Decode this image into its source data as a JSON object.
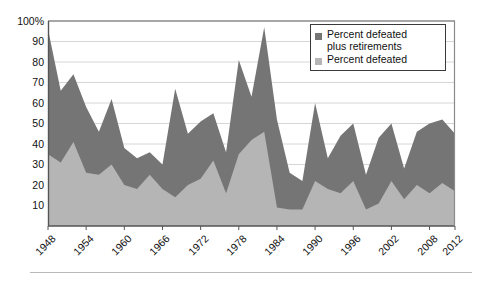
{
  "chart_data": {
    "type": "area",
    "title": "",
    "subtitle": "",
    "xlabel": "",
    "ylabel": "",
    "ylim": [
      0,
      100
    ],
    "yticks": [
      "10",
      "20",
      "30",
      "40",
      "50",
      "60",
      "70",
      "80",
      "90",
      "100%"
    ],
    "ytick_values": [
      10,
      20,
      30,
      40,
      50,
      60,
      70,
      80,
      90,
      100
    ],
    "grid": true,
    "legend_position": "top-right",
    "x": [
      1948,
      1950,
      1952,
      1954,
      1956,
      1958,
      1960,
      1962,
      1964,
      1966,
      1968,
      1970,
      1972,
      1974,
      1976,
      1978,
      1980,
      1982,
      1984,
      1986,
      1988,
      1990,
      1992,
      1994,
      1996,
      1998,
      2000,
      2002,
      2004,
      2006,
      2008,
      2010,
      2012
    ],
    "xtick_labels": [
      "1948",
      "1954",
      "1960",
      "1966",
      "1972",
      "1978",
      "1984",
      "1990",
      "1996",
      "2002",
      "2008",
      "2012"
    ],
    "xtick_values": [
      1948,
      1954,
      1960,
      1966,
      1972,
      1978,
      1984,
      1990,
      1996,
      2002,
      2008,
      2012
    ],
    "series": [
      {
        "name": "Percent defeated plus retirements",
        "color": "#757575",
        "values": [
          96,
          66,
          74,
          58,
          46,
          62,
          38,
          33,
          36,
          30,
          67,
          45,
          51,
          55,
          36,
          81,
          63,
          97,
          52,
          26,
          22,
          60,
          33,
          44,
          50,
          25,
          43,
          50,
          28,
          46,
          50,
          52,
          45
        ]
      },
      {
        "name": "Percent defeated",
        "color": "#b5b5b5",
        "values": [
          35,
          31,
          41,
          26,
          25,
          30,
          20,
          18,
          25,
          18,
          14,
          20,
          23,
          32,
          16,
          35,
          42,
          46,
          9,
          8,
          8,
          22,
          18,
          16,
          22,
          8,
          11,
          22,
          13,
          20,
          16,
          21,
          17
        ]
      }
    ]
  },
  "legend": {
    "entries": [
      {
        "label": "Percent defeated\nplus retirements",
        "swatch_name": "legend-swatch-defeated-plus-retirements"
      },
      {
        "label": "Percent defeated",
        "swatch_name": "legend-swatch-defeated"
      }
    ]
  },
  "colors": {
    "dark_series": "#757575",
    "light_series": "#b5b5b5",
    "gridline": "#d6d6d6",
    "axis": "#555555",
    "text": "#111111",
    "background": "#ffffff",
    "bottom_rule": "#b9b9b9"
  }
}
